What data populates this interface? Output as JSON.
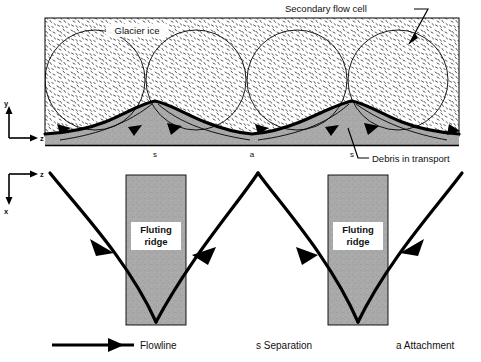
{
  "figure": {
    "background_color": "#ffffff",
    "ink_color": "#000000",
    "debris_fill": "#a8a8a8",
    "ridge_fill": "#a8a8a8",
    "ice_fill": "#ffffff"
  },
  "upper_panel": {
    "name": "cross-section",
    "labels": {
      "glacier_ice": "Glacier ice",
      "secondary_flow_cell": "Secondary flow cell",
      "debris_in_transport": "Debris in transport"
    },
    "bed_markers": [
      {
        "symbol": "s",
        "x": 155
      },
      {
        "symbol": "a",
        "x": 252
      },
      {
        "symbol": "s",
        "x": 352
      }
    ],
    "axes": {
      "vertical_label": "y",
      "horizontal_label": "z"
    },
    "flow_cells": [
      {
        "cx": 95,
        "cy": 80,
        "r": 50
      },
      {
        "cx": 196,
        "cy": 80,
        "r": 50
      },
      {
        "cx": 297,
        "cy": 80,
        "r": 50
      },
      {
        "cx": 398,
        "cy": 80,
        "r": 50
      }
    ]
  },
  "lower_panel": {
    "name": "plan-view",
    "axes": {
      "horizontal_label": "z",
      "vertical_label": "x"
    },
    "ridges": [
      {
        "label_line1": "Fluting",
        "label_line2": "ridge",
        "x": 126,
        "width": 60
      },
      {
        "label_line1": "Fluting",
        "label_line2": "ridge",
        "x": 328,
        "width": 60
      }
    ]
  },
  "legend": {
    "flowline": "Flowline",
    "separation": "s Separation",
    "attachment": "a Attachment"
  }
}
